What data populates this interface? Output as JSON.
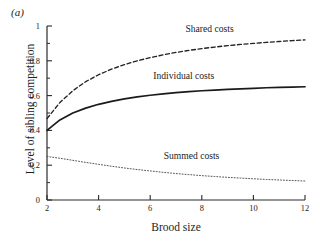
{
  "figure": {
    "panel_label": "(a)",
    "xlabel": "Brood size",
    "ylabel": "Level of sibling competition"
  },
  "chart_data": {
    "type": "line",
    "title": "",
    "panel": "(a)",
    "xlabel": "Brood size",
    "ylabel": "Level of sibling competition",
    "xlim": [
      2,
      12
    ],
    "ylim": [
      0,
      1
    ],
    "xticks": [
      2,
      4,
      6,
      8,
      10,
      12
    ],
    "xticklabels": [
      "2",
      "4",
      "6",
      "8",
      "10",
      "12"
    ],
    "yticks": [
      0,
      0.2,
      0.4,
      0.6,
      0.8,
      1
    ],
    "yticklabels": [
      "0",
      "0.2",
      "0.4",
      "0.6",
      "0.8",
      "1"
    ],
    "y_minor_ticks": [
      0.1,
      0.3,
      0.5,
      0.7,
      0.9
    ],
    "grid": false,
    "legend": "inline-annotations",
    "x": [
      2,
      2.5,
      3,
      3.5,
      4,
      4.5,
      5,
      5.5,
      6,
      6.5,
      7,
      7.5,
      8,
      8.5,
      9,
      9.5,
      10,
      10.5,
      11,
      11.5,
      12
    ],
    "series": [
      {
        "name": "Shared costs",
        "style": "dashed",
        "color": "#222222",
        "label_x": 8.3,
        "label_y": 0.965,
        "values": [
          0.468,
          0.56,
          0.628,
          0.68,
          0.72,
          0.752,
          0.778,
          0.8,
          0.818,
          0.834,
          0.848,
          0.86,
          0.87,
          0.879,
          0.887,
          0.894,
          0.9,
          0.906,
          0.911,
          0.916,
          0.92
        ]
      },
      {
        "name": "Individual costs",
        "style": "solid",
        "color": "#1a1a1a",
        "label_x": 7.3,
        "label_y": 0.695,
        "values": [
          0.4,
          0.46,
          0.5,
          0.528,
          0.55,
          0.567,
          0.581,
          0.593,
          0.602,
          0.61,
          0.617,
          0.623,
          0.628,
          0.632,
          0.636,
          0.639,
          0.642,
          0.645,
          0.647,
          0.649,
          0.651
        ]
      },
      {
        "name": "Summed costs",
        "style": "dotted",
        "color": "#555555",
        "label_x": 7.6,
        "label_y": 0.235,
        "values": [
          0.25,
          0.24,
          0.228,
          0.216,
          0.205,
          0.194,
          0.184,
          0.175,
          0.167,
          0.159,
          0.152,
          0.146,
          0.14,
          0.135,
          0.13,
          0.126,
          0.122,
          0.118,
          0.115,
          0.112,
          0.109
        ]
      }
    ]
  }
}
